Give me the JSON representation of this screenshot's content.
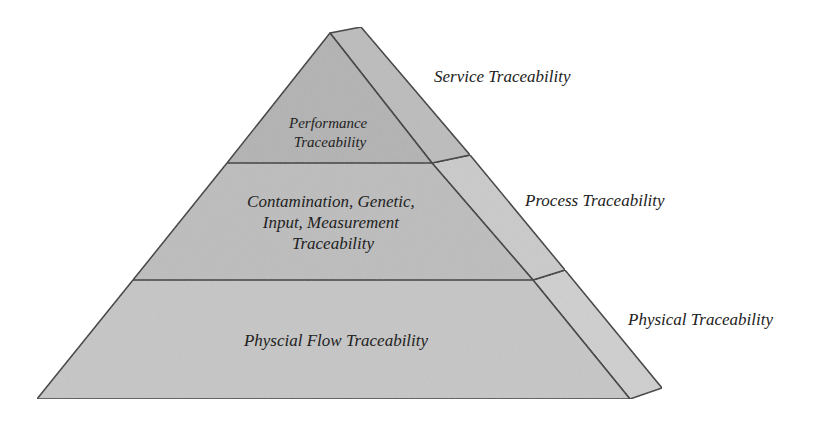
{
  "diagram": {
    "type": "pyramid",
    "colors": {
      "background": "#ffffff",
      "front_top": "#b3b3b3",
      "front_middle": "#bdbdbd",
      "front_bottom": "#c6c6c6",
      "side_top": "#bcbcbc",
      "side_middle": "#cacaca",
      "side_bottom": "#cfcfcf",
      "outline": "#3a3a3a",
      "text": "#222222"
    },
    "tiers": [
      {
        "level": "top",
        "lines": [
          "Performance",
          "Traceability"
        ],
        "side_label": "Service Traceability"
      },
      {
        "level": "middle",
        "lines": [
          "Contamination, Genetic,",
          "Input, Measurement",
          "Traceability"
        ],
        "side_label": "Process Traceability"
      },
      {
        "level": "bottom",
        "lines": [
          "Physcial Flow Traceability"
        ],
        "side_label": "Physical Traceability"
      }
    ]
  }
}
